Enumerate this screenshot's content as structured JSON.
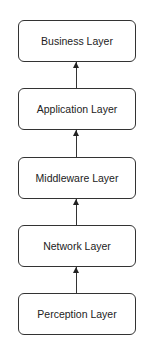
{
  "diagram": {
    "type": "layered-architecture",
    "direction": "bottom-to-top",
    "layers": [
      {
        "label": "Business Layer"
      },
      {
        "label": "Application Layer"
      },
      {
        "label": "Middleware Layer"
      },
      {
        "label": "Network Layer"
      },
      {
        "label": "Perception Layer"
      }
    ],
    "edges": [
      {
        "from": "Application Layer",
        "to": "Business Layer"
      },
      {
        "from": "Middleware Layer",
        "to": "Application Layer"
      },
      {
        "from": "Network Layer",
        "to": "Middleware Layer"
      },
      {
        "from": "Perception Layer",
        "to": "Network Layer"
      }
    ],
    "colors": {
      "stroke": "#333333",
      "fill": "#ffffff",
      "text": "#222222"
    }
  }
}
